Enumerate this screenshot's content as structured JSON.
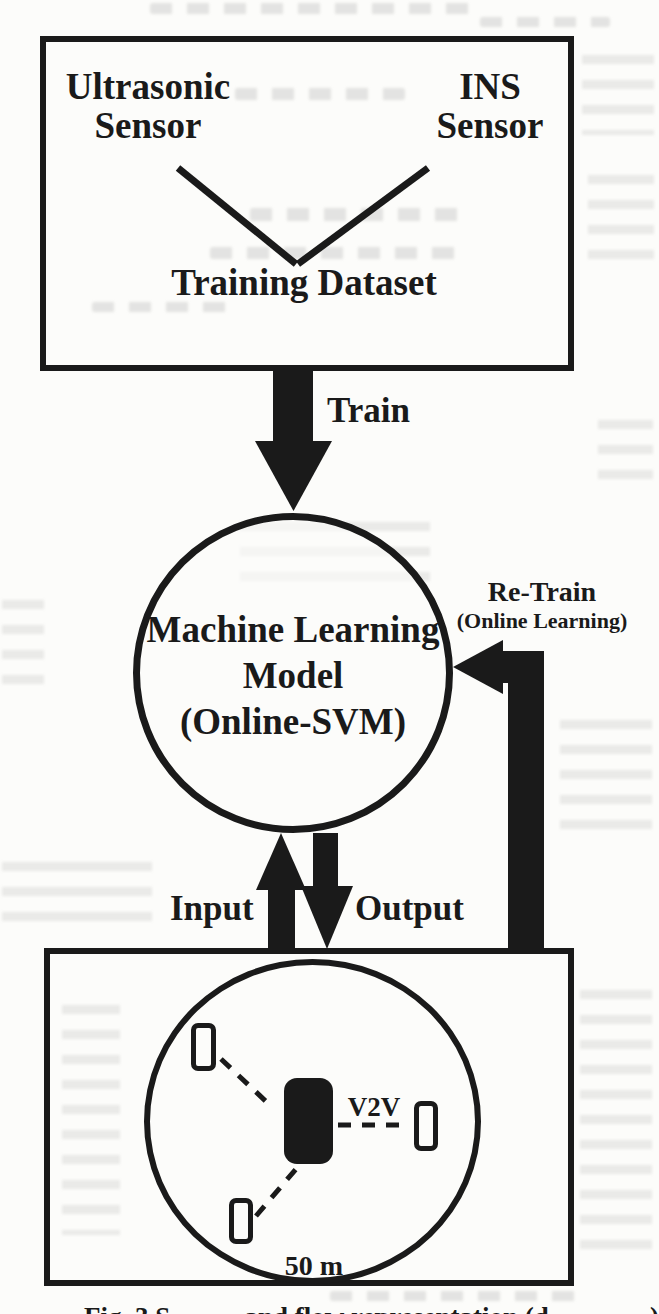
{
  "figure": {
    "caption": "Fig. 3   S_____ and flow representation (d___ ____)"
  },
  "top_box": {
    "ultrasonic": {
      "lines": [
        "Ultrasonic",
        "Sensor"
      ]
    },
    "ins": {
      "lines": [
        "INS",
        "Sensor"
      ]
    },
    "dataset_label": "Training Dataset"
  },
  "train_arrow": {
    "label": "Train"
  },
  "ml_circle": {
    "lines": [
      "Machine Learning",
      "Model",
      "(Online-SVM)"
    ]
  },
  "retrain": {
    "lines": [
      "Re-Train",
      "(Online Learning)"
    ]
  },
  "io": {
    "input_label": "Input",
    "output_label": "Output"
  },
  "scenario_box": {
    "v2v_label": "V2V",
    "range_label": "50 m"
  },
  "colors": {
    "ink": "#1a1a1a",
    "paper": "#fcfcfa"
  }
}
